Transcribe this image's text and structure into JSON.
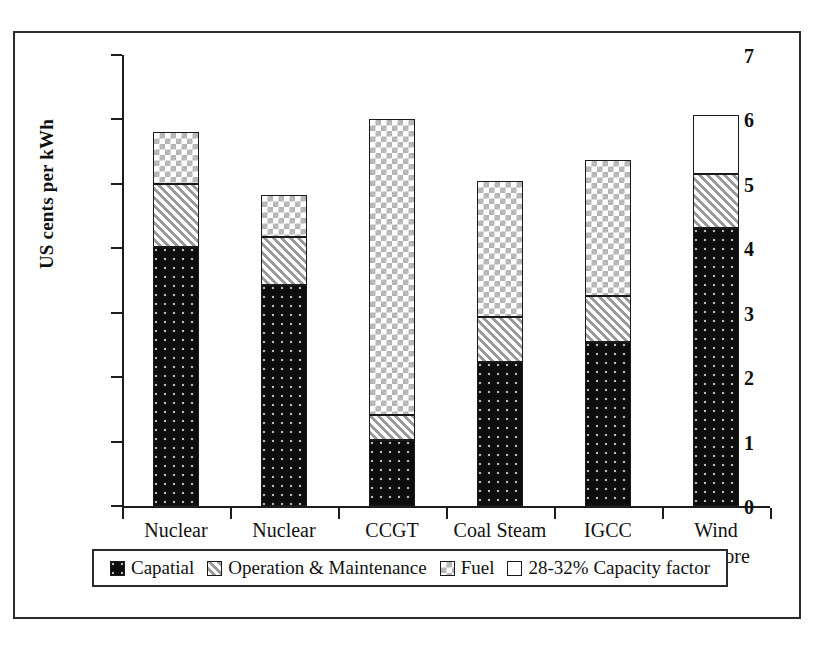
{
  "chart_data": {
    "type": "bar",
    "subtype": "stacked",
    "title": "",
    "xlabel": "",
    "ylabel": "US cents per kWh",
    "ylim": [
      0,
      7
    ],
    "yticks": [
      "0",
      "1",
      "2",
      "3",
      "4",
      "5",
      "6",
      "7"
    ],
    "grid": false,
    "legend_position": "bottom",
    "categories": [
      "Nuclear\nHigh",
      "Nuclear\nLow",
      "CCGT",
      "Coal Steam",
      "IGCC",
      "Wind\nOnshore"
    ],
    "series": [
      {
        "name": "Capatial",
        "pattern": "black-dotted",
        "values": [
          4.02,
          3.43,
          1.02,
          2.23,
          2.55,
          4.31
        ]
      },
      {
        "name": "Operation & Maintenance",
        "pattern": "diagonal-hatch",
        "values": [
          0.98,
          0.75,
          0.39,
          0.71,
          0.71,
          0.85
        ]
      },
      {
        "name": "Fuel",
        "pattern": "light-checker",
        "values": [
          0.8,
          0.64,
          4.59,
          2.1,
          2.11,
          0.0
        ]
      },
      {
        "name": "28-32% Capacity factor",
        "pattern": "white",
        "values": [
          0.0,
          0.0,
          0.0,
          0.0,
          0.0,
          0.91
        ]
      }
    ],
    "totals": [
      5.8,
      4.82,
      6.0,
      5.04,
      5.37,
      6.07
    ]
  },
  "legend": {
    "items": [
      {
        "label": "Capatial",
        "swatch": "black-dotted-swatch"
      },
      {
        "label": "Operation & Maintenance",
        "swatch": "diagonal-hatch-swatch"
      },
      {
        "label": "Fuel",
        "swatch": "light-checker-swatch"
      },
      {
        "label": "28-32% Capacity factor",
        "swatch": "white-swatch"
      }
    ]
  },
  "colors": {
    "capital": "#0d0d0d",
    "operation_maintenance": "#c8c8c8",
    "fuel": "#d0d0d0",
    "capacity_factor": "#ffffff",
    "axis": "#1d1d1d",
    "frame": "#2b2b2b"
  }
}
